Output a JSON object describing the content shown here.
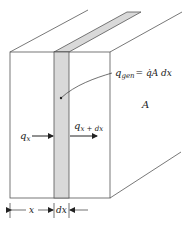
{
  "diagram": {
    "colors": {
      "line": "#444444",
      "slab_fill": "#d9d9d9",
      "background": "#ffffff"
    },
    "labels": {
      "q_gen_main": "q",
      "q_gen_sub": "gen",
      "q_gen_rhs": "= q̇A dx",
      "area": "A",
      "q_x_main": "q",
      "q_x_sub": "x",
      "q_xdx_main": "q",
      "q_xdx_sub": "x + dx",
      "dim_x": "x",
      "dim_dx": "dx"
    }
  }
}
